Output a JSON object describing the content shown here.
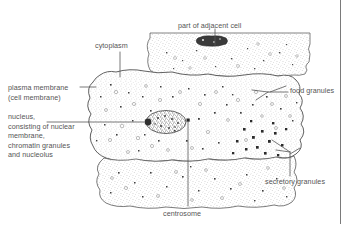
{
  "figure": {
    "style": "stippled line drawing",
    "ink_color": "#555555",
    "background_color": "#ffffff",
    "border": {
      "right_rule": true
    }
  },
  "labels": {
    "cytoplasm": "cytoplasm",
    "adjacent_cell": "part of adjacent cell",
    "plasma_membrane": "plasma membrane\n(cell membrane)",
    "nucleus": "nucleus,\nconsisting of nuclear\nmembrane,\nchromatin granules\nand nucleolus",
    "food_granules": "food granules",
    "secretory_granules": "secretory granules",
    "centrosome": "centrosome"
  },
  "structures": {
    "main_cell": "central cell with irregular stippled outline",
    "adjacent_cell_top": "partial cell strip across the top",
    "adjacent_cell_bottom": "partial cell strip across the bottom",
    "nucleus_body": "oval stippled nucleus with chromatin granules",
    "nucleolus": "dark round nucleolus at left edge of nucleus",
    "centrosome_body": "small dark square body right of nucleus",
    "adjacent_nucleus": "dark irregular nucleus in top adjacent cell",
    "food_granule_dots": "open circles in cytoplasm",
    "secretory_granule_dots": "solid dark squares clustered lower right"
  }
}
